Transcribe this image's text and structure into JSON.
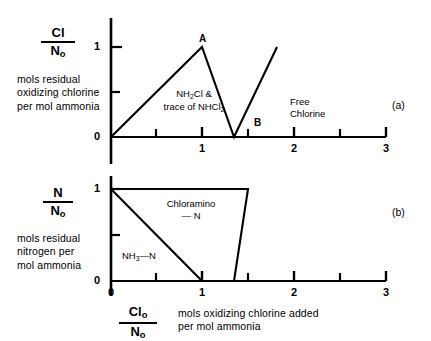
{
  "figure": {
    "panel_a_label": "(a)",
    "panel_b_label": "(b)"
  },
  "panel_a": {
    "y_axis": {
      "fraction_numerator": "Cl",
      "fraction_denominator": "N",
      "fraction_denominator_sub": "o",
      "caption": "mols residual\noxidizing chlorine\nper mol ammonia",
      "tick_labels": [
        "0",
        "1"
      ],
      "tick_values": [
        0,
        1
      ]
    },
    "x_axis": {
      "tick_labels": [
        "0",
        "1",
        "2",
        "3"
      ],
      "tick_values": [
        0,
        1,
        2,
        3
      ],
      "minor_tick_values": [
        0.5,
        1.5,
        2.5
      ]
    },
    "annotations": [
      {
        "name": "peak-a",
        "text": "A"
      },
      {
        "name": "breakpoint-b",
        "text": "B"
      },
      {
        "name": "monochloramine-region",
        "line1": "NH",
        "sub1": "2",
        "line1b": "Cl &",
        "line2": "trace of NHCl",
        "sub2": "2"
      },
      {
        "name": "free-chlorine-region",
        "line1": "Free",
        "line2": "Chlorine"
      }
    ]
  },
  "panel_b": {
    "y_axis": {
      "fraction_numerator": "N",
      "fraction_denominator": "N",
      "fraction_denominator_sub": "o",
      "caption": "mols residual\nnitrogen per\nmol ammonia",
      "tick_labels": [
        "0",
        "1"
      ],
      "tick_values": [
        0,
        1
      ]
    },
    "x_axis": {
      "fraction_numerator": "Cl",
      "fraction_numerator_sub": "o",
      "fraction_denominator": "N",
      "fraction_denominator_sub": "o",
      "caption": "mols oxidizing chlorine added\nper mol ammonia",
      "tick_labels": [
        "0",
        "1",
        "2",
        "3"
      ],
      "tick_values": [
        0,
        1,
        2,
        3
      ],
      "minor_tick_values": [
        0.5,
        1.5,
        2.5
      ]
    },
    "annotations": [
      {
        "name": "chloramine-n-region",
        "line1": "Chloramino",
        "line2": "— N"
      },
      {
        "name": "ammonia-n-region",
        "line1": "NH",
        "sub1": "3",
        "line1b": "—N"
      }
    ]
  },
  "chart_data": [
    {
      "type": "line",
      "name": "panel-a-chlorine-residual",
      "title": "Residual oxidizing chlorine vs chlorine added",
      "xlabel": "Clo/No  mols oxidizing chlorine added per mol ammonia",
      "ylabel": "Cl/No  mols residual oxidizing chlorine per mol ammonia",
      "xlim": [
        0,
        3
      ],
      "ylim": [
        0,
        1.12
      ],
      "grid": false,
      "legend": "none",
      "series": [
        {
          "name": "total chlorine residual",
          "x": [
            0,
            1.0,
            1.7,
            2.65
          ],
          "y": [
            0,
            1.0,
            0,
            1.0
          ]
        }
      ],
      "annotations": [
        {
          "label": "A",
          "x": 1.0,
          "y": 1.0
        },
        {
          "label": "B",
          "x": 1.7,
          "y": 0
        },
        {
          "label": "NH2Cl & trace of NHCl2",
          "x": 1.15,
          "y": 0.42
        },
        {
          "label": "Free Chlorine",
          "x": 2.2,
          "y": 0.37
        }
      ]
    },
    {
      "type": "line",
      "name": "panel-b-nitrogen-residual",
      "title": "Residual nitrogen vs chlorine added",
      "xlabel": "Clo/No  mols oxidizing chlorine added per mol ammonia",
      "ylabel": "N/No  mols residual nitrogen per mol ammonia",
      "xlim": [
        0,
        3
      ],
      "ylim": [
        0,
        1.12
      ],
      "grid": false,
      "legend": "none",
      "series": [
        {
          "name": "total residual nitrogen",
          "x": [
            0,
            1.5,
            1.7
          ],
          "y": [
            1.0,
            1.0,
            0
          ]
        },
        {
          "name": "NH3-N (free ammonia nitrogen)",
          "x": [
            0,
            1.0
          ],
          "y": [
            1.0,
            0
          ]
        }
      ],
      "annotations": [
        {
          "label": "Chloramino — N",
          "x": 0.95,
          "y": 0.72
        },
        {
          "label": "NH3—N",
          "x": 0.5,
          "y": 0.3
        }
      ]
    }
  ]
}
